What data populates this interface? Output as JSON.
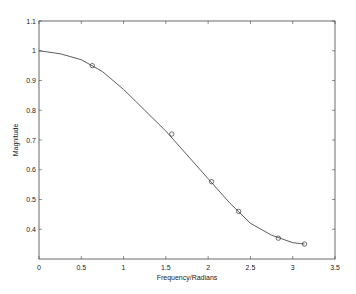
{
  "chart_data": {
    "type": "line",
    "title": "",
    "xlabel": "Frequency/Radians",
    "ylabel": "Magnitude",
    "xlim": [
      0,
      3.5
    ],
    "ylim": [
      0.3,
      1.1
    ],
    "xticks": [
      "0",
      "0.5",
      "1",
      "1.5",
      "2",
      "2.5",
      "3",
      "3.5"
    ],
    "yticks": [
      "0.4",
      "0.5",
      "0.6",
      "0.7",
      "0.8",
      "0.9",
      "1",
      "1.1"
    ],
    "grid": false,
    "series": [
      {
        "name": "curve",
        "style": "line",
        "x": [
          0,
          0.25,
          0.5,
          0.75,
          1,
          1.25,
          1.5,
          1.75,
          2,
          2.25,
          2.5,
          2.75,
          3,
          3.14
        ],
        "y": [
          1,
          0.99,
          0.97,
          0.93,
          0.87,
          0.8,
          0.73,
          0.65,
          0.57,
          0.49,
          0.42,
          0.38,
          0.355,
          0.35
        ]
      },
      {
        "name": "samples",
        "style": "circle-markers",
        "x": [
          0.63,
          1.57,
          2.04,
          2.36,
          2.83,
          3.14
        ],
        "y": [
          0.95,
          0.72,
          0.56,
          0.46,
          0.37,
          0.35
        ]
      }
    ]
  }
}
